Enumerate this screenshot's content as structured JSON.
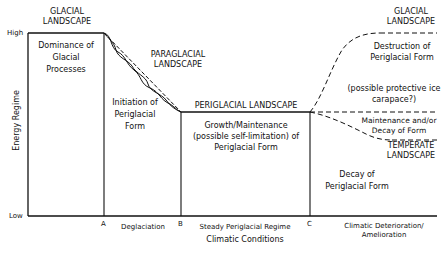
{
  "diagram": {
    "y_axis": {
      "label": "Energy Regime",
      "high": "High",
      "low": "Low"
    },
    "x_axis": {
      "title": "Climatic Conditions",
      "points": [
        "A",
        "B",
        "C"
      ],
      "phases": [
        "Deglaciation",
        "Steady Periglacial Regime",
        "Climatic Deterioration/ Amelioration"
      ]
    },
    "landscapes": {
      "glacial_left": "GLACIAL LANDSCAPE",
      "paraglacial": "PARAGLACIAL LANDSCAPE",
      "periglacial": "PERIGLACIAL LANDSCAPE",
      "glacial_right": "GLACIAL LANDSCAPE",
      "temperate": "TEMPERATE LANDSCAPE"
    },
    "processes": {
      "dominance": "Dominance of Glacial Processes",
      "initiation": "Initiation of Periglacial Form",
      "growth": "Growth/Maintenance (possible self-limitation) of Periglacial Form",
      "destruction": "Destruction of Periglacial Form",
      "carapace": "(possible protective ice carapace?)",
      "maintenance": "Maintenance and/or Decay of Form",
      "decay": "Decay of Periglacial Form"
    },
    "line_color": "#111111"
  }
}
